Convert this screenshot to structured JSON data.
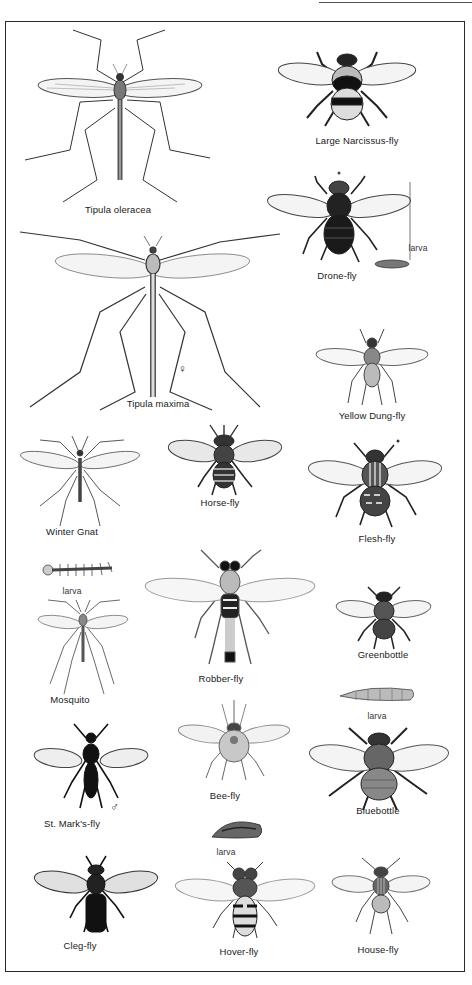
{
  "plate": {
    "title": "",
    "species": [
      {
        "id": "tipula-oleracea",
        "label": "Tipula oleracea",
        "x": 118,
        "y": 212
      },
      {
        "id": "large-narcissus-fly",
        "label": "Large Narcissus-fly",
        "x": 357,
        "y": 143
      },
      {
        "id": "drone-fly",
        "label": "Drone-fly",
        "x": 337,
        "y": 278
      },
      {
        "id": "tipula-maxima",
        "label": "Tipula maxima",
        "x": 158,
        "y": 405
      },
      {
        "id": "yellow-dung-fly",
        "label": "Yellow Dung-fly",
        "x": 372,
        "y": 418
      },
      {
        "id": "winter-gnat",
        "label": "Winter Gnat",
        "x": 72,
        "y": 533
      },
      {
        "id": "horse-fly",
        "label": "Horse-fly",
        "x": 220,
        "y": 504
      },
      {
        "id": "flesh-fly",
        "label": "Flesh-fly",
        "x": 377,
        "y": 540
      },
      {
        "id": "mosquito",
        "label": "Mosquito",
        "x": 70,
        "y": 700
      },
      {
        "id": "robber-fly",
        "label": "Robber-fly",
        "x": 221,
        "y": 680
      },
      {
        "id": "greenbottle",
        "label": "Greenbottle",
        "x": 383,
        "y": 656
      },
      {
        "id": "st-marks-fly",
        "label": "St. Mark's-fly",
        "x": 72,
        "y": 825
      },
      {
        "id": "bee-fly",
        "label": "Bee-fly",
        "x": 225,
        "y": 796
      },
      {
        "id": "bluebottle",
        "label": "Bluebottle",
        "x": 378,
        "y": 812
      },
      {
        "id": "cleg-fly",
        "label": "Cleg-fly",
        "x": 80,
        "y": 946
      },
      {
        "id": "hover-fly",
        "label": "Hover-fly",
        "x": 239,
        "y": 952
      },
      {
        "id": "house-fly",
        "label": "House-fly",
        "x": 378,
        "y": 950
      }
    ],
    "annotations": [
      {
        "id": "drone-fly-larva-label",
        "text": "larva",
        "x": 418,
        "y": 248
      },
      {
        "id": "mosquito-larva-label",
        "text": "larva",
        "x": 72,
        "y": 592
      },
      {
        "id": "bluebottle-larva-label",
        "text": "larva",
        "x": 377,
        "y": 716
      },
      {
        "id": "hover-fly-larva-label",
        "text": "larva",
        "x": 226,
        "y": 852
      }
    ],
    "symbols": {
      "female": "♀",
      "male": "♂"
    },
    "colors": {
      "ink": "#1a1a1a",
      "frame": "#2a2a2a",
      "background": "#ffffff",
      "wing": "#f2f2f2"
    }
  }
}
